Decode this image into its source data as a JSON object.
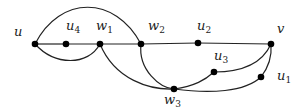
{
  "diagram": {
    "type": "graph",
    "vertices": [
      {
        "id": "u",
        "label": "u",
        "sub": "",
        "x": 35,
        "y": 44,
        "lx": 14,
        "ly": 36
      },
      {
        "id": "u4",
        "label": "u",
        "sub": "4",
        "x": 66,
        "y": 44,
        "lx": 66,
        "ly": 30
      },
      {
        "id": "w1",
        "label": "w",
        "sub": "1",
        "x": 100,
        "y": 44,
        "lx": 96,
        "ly": 30
      },
      {
        "id": "w2",
        "label": "w",
        "sub": "2",
        "x": 141,
        "y": 44,
        "lx": 148,
        "ly": 30
      },
      {
        "id": "u2",
        "label": "u",
        "sub": "2",
        "x": 198,
        "y": 43,
        "lx": 197,
        "ly": 30
      },
      {
        "id": "v",
        "label": "v",
        "sub": "",
        "x": 271,
        "y": 44,
        "lx": 277,
        "ly": 33
      },
      {
        "id": "u3",
        "label": "u",
        "sub": "3",
        "x": 214,
        "y": 72,
        "lx": 214,
        "ly": 60
      },
      {
        "id": "u1",
        "label": "u",
        "sub": "1",
        "x": 261,
        "y": 77,
        "lx": 277,
        "ly": 80
      },
      {
        "id": "w3",
        "label": "w",
        "sub": "3",
        "x": 174,
        "y": 89,
        "lx": 164,
        "ly": 104
      }
    ],
    "edges": [
      {
        "from": "u",
        "to": "u4",
        "path": "M35,44 L66,44"
      },
      {
        "from": "u4",
        "to": "w1",
        "path": "M66,44 L100,44"
      },
      {
        "from": "w1",
        "to": "w2",
        "path": "M100,44 L141,44"
      },
      {
        "from": "w2",
        "to": "u2",
        "path": "M141,44 L198,43"
      },
      {
        "from": "u2",
        "to": "v",
        "path": "M198,43 L271,44"
      },
      {
        "from": "u",
        "to": "w2",
        "path": "M35,44 C60,-5 115,-5 141,44"
      },
      {
        "from": "u",
        "to": "w1",
        "path": "M35,44 C55,66 88,66 100,44"
      },
      {
        "from": "w1",
        "to": "w3",
        "path": "M100,44 C115,80 150,90 174,89"
      },
      {
        "from": "w2",
        "to": "w3",
        "path": "M141,44 C138,70 160,88 174,89"
      },
      {
        "from": "w3",
        "to": "u3",
        "path": "M174,89 C195,86 205,80 214,72"
      },
      {
        "from": "u3",
        "to": "v",
        "path": "M214,72 C240,72 262,64 271,44"
      },
      {
        "from": "w3",
        "to": "u1",
        "path": "M174,89 C210,94 245,92 261,77"
      },
      {
        "from": "u1",
        "to": "v",
        "path": "M261,77 C268,68 272,56 271,44"
      }
    ]
  }
}
